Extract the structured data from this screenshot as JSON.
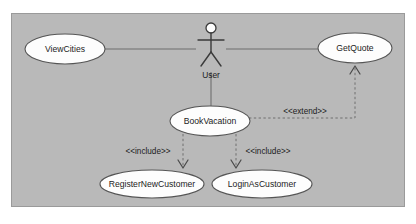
{
  "diagram": {
    "type": "uml-use-case-diagram",
    "canvas": {
      "width": 416,
      "height": 224
    },
    "colors": {
      "page_background": "#ffffff",
      "frame_background": "#b9b9b9",
      "frame_border": "#9a9a9a",
      "ellipse_fill": "#fdfdfd",
      "ellipse_border": "#555555",
      "line": "#6f6f6f",
      "text": "#1c1c1c"
    },
    "frame": {
      "x": 11,
      "y": 13,
      "width": 394,
      "height": 194
    },
    "actor": {
      "name": "actor-user",
      "label": "User",
      "x": 211,
      "y": 44,
      "label_x": 211,
      "label_y": 75
    },
    "use_cases": [
      {
        "id": "view-cities",
        "label": "ViewCities",
        "cx": 65,
        "cy": 49,
        "rx": 40,
        "ry": 15
      },
      {
        "id": "get-quote",
        "label": "GetQuote",
        "cx": 355,
        "cy": 48,
        "rx": 37,
        "ry": 15
      },
      {
        "id": "book-vacation",
        "label": "BookVacation",
        "cx": 210,
        "cy": 121,
        "rx": 40,
        "ry": 15
      },
      {
        "id": "register-new-customer",
        "label": "RegisterNewCustomer",
        "cx": 152,
        "cy": 184,
        "rx": 52,
        "ry": 14
      },
      {
        "id": "login-as-customer",
        "label": "LoginAsCustomer",
        "cx": 262,
        "cy": 184,
        "rx": 50,
        "ry": 14
      }
    ],
    "associations": [
      {
        "id": "assoc-user-viewcities",
        "from": "view-cities",
        "to": "actor-user",
        "path": "M 105 49 L 196 49"
      },
      {
        "id": "assoc-user-getquote",
        "from": "actor-user",
        "to": "get-quote",
        "path": "M 226 49 L 318 49"
      },
      {
        "id": "assoc-user-bookvacation",
        "from": "actor-user",
        "to": "book-vacation",
        "path": "M 211 72 L 211 106"
      }
    ],
    "dependencies": [
      {
        "id": "include-register-new-customer",
        "stereotype": "<<include>>",
        "from": "book-vacation",
        "to": "register-new-customer",
        "path": "M 183 134 L 183 166",
        "arrow": "M 178 160 L 183 168 L 188 160",
        "label_x": 148,
        "label_y": 152
      },
      {
        "id": "include-login-as-customer",
        "stereotype": "<<include>>",
        "from": "book-vacation",
        "to": "login-as-customer",
        "path": "M 236 134 L 236 166",
        "arrow": "M 231 160 L 236 168 L 241 160",
        "label_x": 268,
        "label_y": 152
      },
      {
        "id": "extend-get-quote",
        "stereotype": "<<extend>>",
        "from": "book-vacation",
        "to": "get-quote",
        "path": "M 249 118 L 355 118 L 355 68",
        "arrow": "M 350 74 L 355 66 L 360 74",
        "label_x": 305,
        "label_y": 112
      }
    ]
  }
}
